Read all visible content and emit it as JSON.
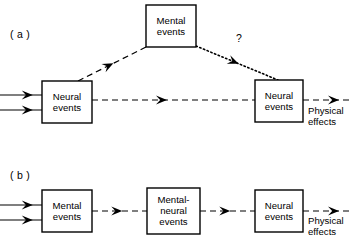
{
  "figure": {
    "background_color": "#ffffff",
    "stroke_color": "#000000",
    "panels": [
      {
        "id": "panel-a",
        "label": "( a )",
        "label_x": 10,
        "label_y": 28,
        "boxes": [
          {
            "id": "a-neural-left",
            "name": "neural-events-box-left",
            "text": "Neural\nevents",
            "x": 42,
            "y": 81,
            "w": 50,
            "h": 42
          },
          {
            "id": "a-mental-top",
            "name": "mental-events-box-top",
            "text": "Mental\nevents",
            "x": 146,
            "y": 5,
            "w": 50,
            "h": 42
          },
          {
            "id": "a-neural-right",
            "name": "neural-events-box-right",
            "text": "Neural\nevents",
            "x": 255,
            "y": 80,
            "w": 48,
            "h": 42
          }
        ],
        "free_labels": [
          {
            "id": "a-physical-effects",
            "name": "physical-effects-label",
            "text": "Physical\neffects",
            "x": 308,
            "y": 105
          }
        ],
        "annotations": [
          {
            "id": "a-question-mark",
            "name": "question-mark-annotation",
            "text": "?",
            "x": 236,
            "y": 32
          }
        ],
        "connectors": [
          {
            "id": "a-in-1",
            "name": "input-arrow-upper",
            "style": "solid",
            "from": [
              0,
              95
            ],
            "to": [
              42,
              95
            ],
            "arrow_at": 0.78
          },
          {
            "id": "a-in-2",
            "name": "input-arrow-lower",
            "style": "solid",
            "from": [
              0,
              110
            ],
            "to": [
              42,
              110
            ],
            "arrow_at": 0.78
          },
          {
            "id": "a-neural-to-mental",
            "name": "neural-to-mental-arrow",
            "style": "dashed",
            "from": [
              78,
              81
            ],
            "to": [
              146,
              47
            ],
            "arrow_at": 0.52
          },
          {
            "id": "a-mental-to-neural",
            "name": "mental-to-neural-dotted-arrow",
            "style": "dotted",
            "from": [
              196,
              46
            ],
            "to": [
              278,
              80
            ],
            "arrow_at": 0.52
          },
          {
            "id": "a-neural-to-neural",
            "name": "neural-to-neural-arrow",
            "style": "dashed",
            "from": [
              92,
              100
            ],
            "to": [
              255,
              100
            ],
            "arrow_at": 0.46
          },
          {
            "id": "a-out",
            "name": "physical-effects-arrow",
            "style": "dashed",
            "from": [
              303,
              100
            ],
            "to": [
              353,
              100
            ],
            "arrow_at": 0.72
          }
        ]
      },
      {
        "id": "panel-b",
        "label": "( b )",
        "label_x": 10,
        "label_y": 169,
        "boxes": [
          {
            "id": "b-mental",
            "name": "mental-events-box",
            "text": "Mental\nevents",
            "x": 42,
            "y": 190,
            "w": 50,
            "h": 42
          },
          {
            "id": "b-mental-neural",
            "name": "mental-neural-events-box",
            "text": "Mental-\nneural\nevents",
            "x": 147,
            "y": 188,
            "w": 53,
            "h": 46
          },
          {
            "id": "b-neural",
            "name": "neural-events-box",
            "text": "Neural\nevents",
            "x": 255,
            "y": 190,
            "w": 48,
            "h": 42
          }
        ],
        "free_labels": [
          {
            "id": "b-physical-effects",
            "name": "physical-effects-label",
            "text": "Physical\neffects",
            "x": 308,
            "y": 215
          }
        ],
        "annotations": [],
        "connectors": [
          {
            "id": "b-in-1",
            "name": "input-arrow-upper",
            "style": "solid",
            "from": [
              0,
              205
            ],
            "to": [
              42,
              205
            ],
            "arrow_at": 0.78
          },
          {
            "id": "b-in-2",
            "name": "input-arrow-lower",
            "style": "solid",
            "from": [
              0,
              220
            ],
            "to": [
              42,
              220
            ],
            "arrow_at": 0.78
          },
          {
            "id": "b-mental-to-mn",
            "name": "mental-to-mental-neural-arrow",
            "style": "dashed",
            "from": [
              92,
              211
            ],
            "to": [
              147,
              211
            ],
            "arrow_at": 0.55
          },
          {
            "id": "b-mn-to-neural",
            "name": "mental-neural-to-neural-arrow",
            "style": "dashed",
            "from": [
              200,
              211
            ],
            "to": [
              255,
              211
            ],
            "arrow_at": 0.55
          },
          {
            "id": "b-out",
            "name": "physical-effects-arrow",
            "style": "dashed",
            "from": [
              303,
              211
            ],
            "to": [
              353,
              211
            ],
            "arrow_at": 0.72
          }
        ]
      }
    ]
  }
}
